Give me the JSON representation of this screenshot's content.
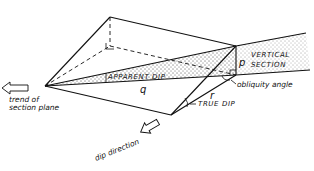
{
  "diagram": {
    "labels": {
      "apparent_dip": "APPARENT DIP",
      "true_dip": "TRUE DIP",
      "vertical": "VERTICAL",
      "section": "SECTION",
      "obliquity_angle": "obliquity angle",
      "trend_line1": "trend of",
      "trend_line2": "section plane",
      "dip_direction": "dip direction",
      "p": "p",
      "q": "q",
      "r": "r"
    },
    "colors": {
      "line": "#111111",
      "background": "#ffffff"
    }
  }
}
